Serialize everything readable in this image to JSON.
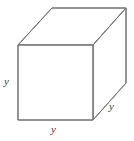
{
  "figure": {
    "name": "cube-diagram",
    "shape": "cube",
    "projection": "oblique",
    "stroke_color": "#707070",
    "fill_color": "#ffffff",
    "background_color": "#ffffff",
    "stroke_width": 1,
    "labels": {
      "height": "y",
      "width": "y",
      "depth": "y"
    },
    "geometry": {
      "front_face": {
        "top_left": [
          18,
          45
        ],
        "top_right": [
          93,
          45
        ],
        "bottom_right": [
          93,
          120
        ],
        "bottom_left": [
          18,
          120
        ]
      },
      "back_offset": [
        34,
        -37
      ],
      "back_face": {
        "top_left": [
          52,
          8
        ],
        "top_right": [
          126,
          8
        ],
        "bottom_right": [
          126,
          83
        ],
        "bottom_left": [
          52,
          45
        ]
      }
    }
  }
}
